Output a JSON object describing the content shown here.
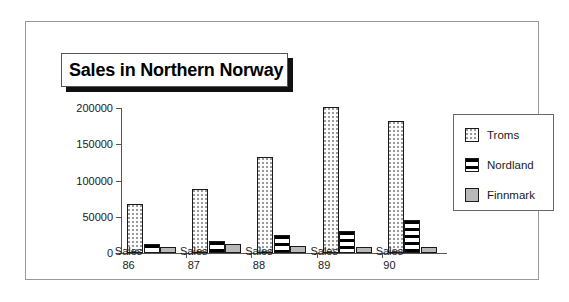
{
  "chart_data": {
    "type": "bar",
    "title": "Sales in Northern Norway",
    "xlabel": "",
    "ylabel": "",
    "ylim": [
      0,
      200000
    ],
    "yticks": [
      0,
      50000,
      100000,
      150000,
      200000
    ],
    "ytick_labels": [
      "0",
      "50000",
      "100000",
      "150000",
      "200000"
    ],
    "grid": false,
    "legend_position": "right",
    "categories": [
      "Sales 86",
      "Sales 87",
      "Sales 88",
      "Sales 89",
      "Sales 90"
    ],
    "category_lines": [
      [
        "Sales",
        "86"
      ],
      [
        "Sales",
        "87"
      ],
      [
        "Sales",
        "88"
      ],
      [
        "Sales",
        "89"
      ],
      [
        "Sales",
        "90"
      ]
    ],
    "series": [
      {
        "name": "Troms",
        "pattern": "dotted",
        "color": "#fbfbfb",
        "values": [
          68000,
          88000,
          133000,
          201000,
          182000
        ]
      },
      {
        "name": "Nordland",
        "pattern": "horizontal-stripes",
        "color": "#ffffff",
        "values": [
          12000,
          17000,
          25000,
          30000,
          45000
        ]
      },
      {
        "name": "Finnmark",
        "pattern": "solid-gray",
        "color": "#b9b9b9",
        "values": [
          8000,
          12000,
          10000,
          8000,
          8000
        ]
      }
    ]
  },
  "legend": {
    "items": [
      {
        "label": "Troms"
      },
      {
        "label": "Nordland"
      },
      {
        "label": "Finnmark"
      }
    ]
  }
}
